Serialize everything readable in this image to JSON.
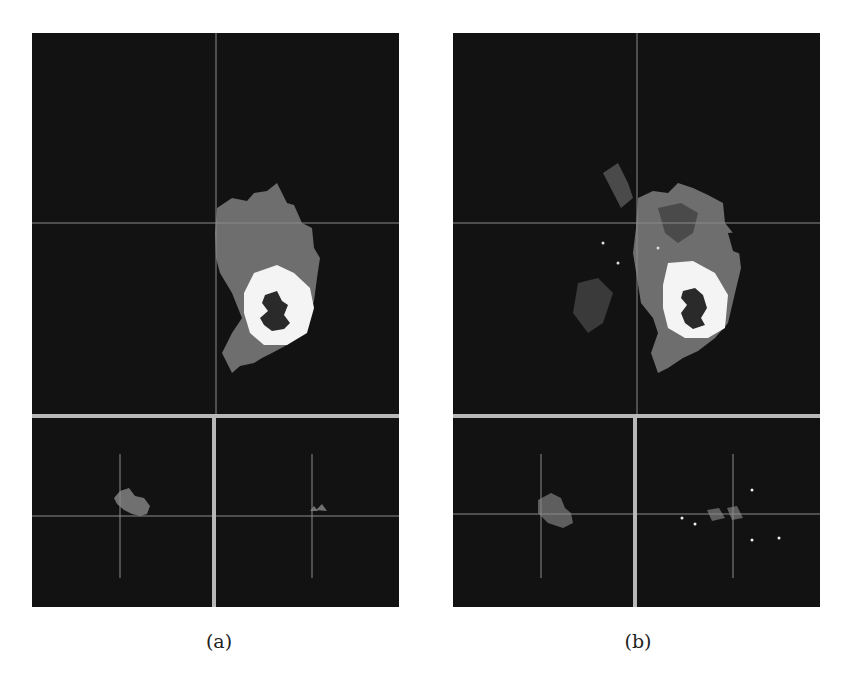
{
  "figure": {
    "panels": [
      {
        "id": "a",
        "caption": "(a)",
        "views": [
          "axial",
          "sagittal",
          "coronal"
        ],
        "description": "Segmentation label map, smooth regions"
      },
      {
        "id": "b",
        "caption": "(b)",
        "views": [
          "axial",
          "sagittal",
          "coronal"
        ],
        "description": "Segmentation label map, noisy regions"
      }
    ],
    "colors": {
      "background": "#121212",
      "separator": "#b8b8b8",
      "crosshair": "#7a7a7a",
      "edema": "#6e6e6e",
      "enhancing": "#f4f4f4",
      "necrosis": "#2a2a2a",
      "dark_region": "#454545"
    }
  }
}
